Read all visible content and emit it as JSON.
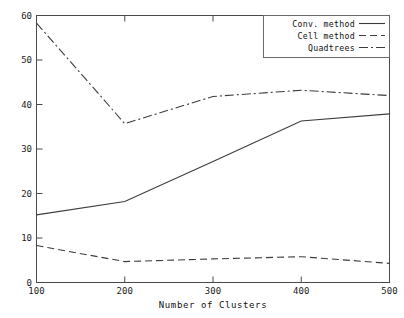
{
  "chart_data": {
    "type": "line",
    "title": "",
    "subtitle": "",
    "xlabel": "Number of Clusters",
    "ylabel": "",
    "x": [
      100,
      200,
      300,
      400,
      500
    ],
    "xlim": [
      100,
      500
    ],
    "ylim": [
      0,
      60
    ],
    "xticks": [
      "100",
      "200",
      "300",
      "400",
      "500"
    ],
    "yticks": [
      "0",
      "10",
      "20",
      "30",
      "40",
      "50",
      "60"
    ],
    "grid": false,
    "legend_position": "top-right-inside",
    "series": [
      {
        "name": "Conv. method",
        "linestyle": "solid",
        "color": "#3c3c3c",
        "values": [
          15.2,
          18.2,
          27.2,
          36.3,
          37.9
        ]
      },
      {
        "name": "Cell method",
        "linestyle": "dashed",
        "color": "#3c3c3c",
        "values": [
          8.3,
          4.7,
          5.3,
          5.8,
          4.3
        ]
      },
      {
        "name": "Quadtrees",
        "linestyle": "dashdot",
        "color": "#3c3c3c",
        "values": [
          58.3,
          35.7,
          41.8,
          43.2,
          42.0
        ]
      }
    ]
  },
  "axes": {
    "x_title": "Number of Clusters",
    "x_tick_labels": [
      "100",
      "200",
      "300",
      "400",
      "500"
    ],
    "y_tick_labels": [
      "0",
      "10",
      "20",
      "30",
      "40",
      "50",
      "60"
    ]
  },
  "legend": {
    "entries": [
      {
        "label": "Conv. method",
        "style": "solid"
      },
      {
        "label": "Cell method",
        "style": "dashed"
      },
      {
        "label": "Quadtrees",
        "style": "dashdot"
      }
    ]
  },
  "colors": {
    "background": "#ffffff",
    "frame": "#4a4a4a",
    "series": "#3c3c3c",
    "text": "#111111"
  }
}
